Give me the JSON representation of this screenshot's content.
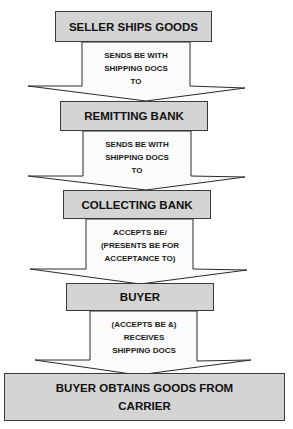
{
  "diagram": {
    "type": "vertical-flowchart",
    "colors": {
      "box_fill": "#d4d4d4",
      "box_border": "#3a3a3a",
      "arrow_fill": "#fbfbfb",
      "arrow_border": "#2a2a2a",
      "text": "#111111"
    },
    "nodes": [
      {
        "id": "seller",
        "label_lines": [
          "SELLER SHIPS GOODS"
        ]
      },
      {
        "id": "remitting-bank",
        "label_lines": [
          "REMITTING BANK"
        ]
      },
      {
        "id": "collecting-bank",
        "label_lines": [
          "COLLECTING BANK"
        ]
      },
      {
        "id": "buyer",
        "label_lines": [
          "BUYER"
        ]
      },
      {
        "id": "buyer-obtains-goods",
        "label_lines": [
          "BUYER OBTAINS GOODS FROM",
          "CARRIER"
        ]
      }
    ],
    "edges": [
      {
        "from": "seller",
        "to": "remitting-bank",
        "label_lines": [
          "SENDS BE WITH",
          "SHIPPING DOCS",
          "TO"
        ]
      },
      {
        "from": "remitting-bank",
        "to": "collecting-bank",
        "label_lines": [
          "SENDS BE WITH",
          "SHIPPING DOCS",
          "TO"
        ]
      },
      {
        "from": "collecting-bank",
        "to": "buyer",
        "label_lines": [
          "ACCEPTS BE/",
          "(PRESENTS BE FOR",
          "ACCEPTANCE TO)"
        ]
      },
      {
        "from": "buyer",
        "to": "buyer-obtains-goods",
        "label_lines": [
          "(ACCEPTS BE &)",
          "RECEIVES",
          "SHIPPING DOCS"
        ]
      }
    ]
  }
}
